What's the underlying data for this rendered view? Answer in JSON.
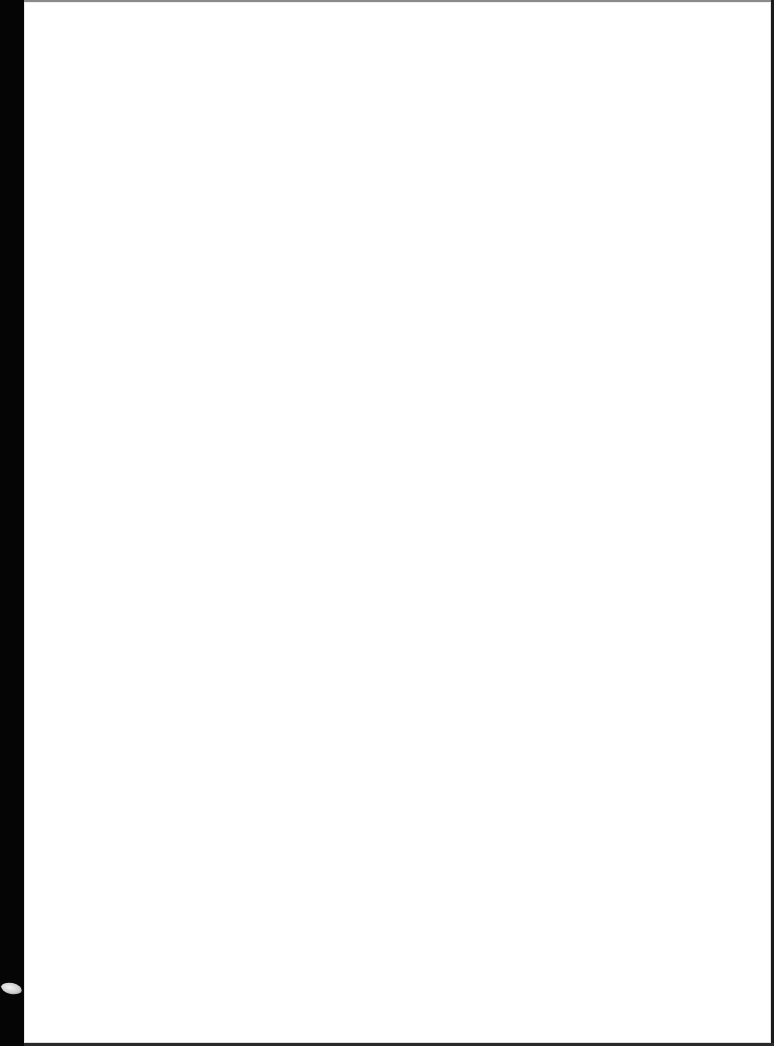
{
  "document": {
    "type": "scanned-page",
    "content_text": "",
    "page_color": "#ffffff",
    "background_color": "#000000",
    "artifacts": [
      {
        "name": "scanner-edge-left",
        "color": "#050505"
      },
      {
        "name": "scanner-blob",
        "color": "#cfcfcf"
      }
    ]
  }
}
